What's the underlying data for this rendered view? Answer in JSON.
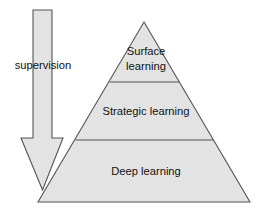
{
  "canvas": {
    "width": 267,
    "height": 214,
    "background_color": "#ffffff"
  },
  "style": {
    "shape_fill_color": "#e3e3e3",
    "shape_stroke_color": "#555555",
    "text_color": "#111111"
  },
  "arrow": {
    "label": "supervision",
    "direction": "down",
    "meaning": "decreasing supervision from top to bottom"
  },
  "pyramid": {
    "apex": {
      "x": 144,
      "y": 22
    },
    "base_left": {
      "x": 38,
      "y": 202
    },
    "base_right": {
      "x": 250,
      "y": 202
    },
    "divider_y_values": [
      82,
      140
    ],
    "tiers": [
      {
        "id": "surface",
        "position": "top",
        "label": "Surface learning",
        "label_lines": [
          "Surface",
          "learning"
        ]
      },
      {
        "id": "strategic",
        "position": "middle",
        "label": "Strategic learning",
        "label_lines": [
          "Strategic learning"
        ]
      },
      {
        "id": "deep",
        "position": "bottom",
        "label": "Deep learning",
        "label_lines": [
          "Deep learning"
        ]
      }
    ]
  }
}
